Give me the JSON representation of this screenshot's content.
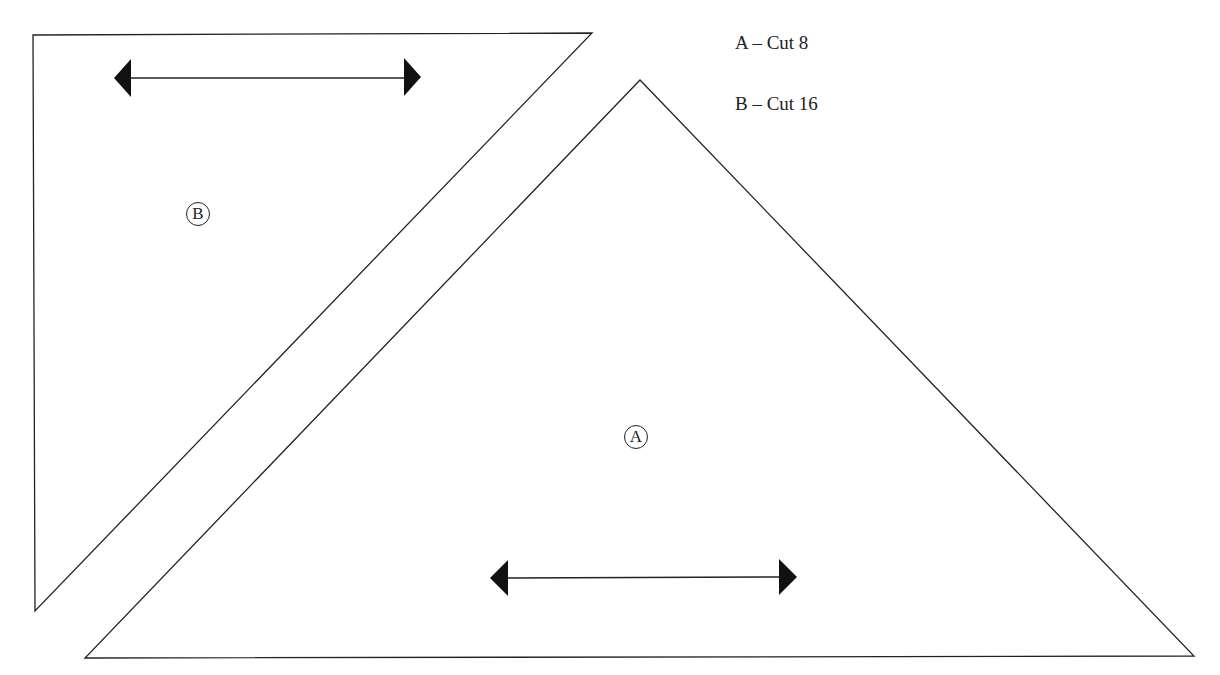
{
  "legend": {
    "lines": [
      {
        "piece": "A",
        "text": "A – Cut 8"
      },
      {
        "piece": "B",
        "text": "B – Cut 16"
      }
    ]
  },
  "pieces": {
    "A": {
      "label": "A",
      "shape": "triangle",
      "vertices": [
        [
          640,
          80
        ],
        [
          85,
          658
        ],
        [
          1194,
          656
        ]
      ],
      "grainline": {
        "x1": 492,
        "y1": 577,
        "x2": 797,
        "y2": 577
      }
    },
    "B": {
      "label": "B",
      "shape": "triangle",
      "vertices": [
        [
          33,
          35
        ],
        [
          592,
          33
        ],
        [
          35,
          611
        ]
      ],
      "grainline": {
        "x1": 115,
        "y1": 78,
        "x2": 421,
        "y2": 78
      }
    }
  },
  "colors": {
    "stroke": "#222222",
    "background": "#ffffff"
  }
}
